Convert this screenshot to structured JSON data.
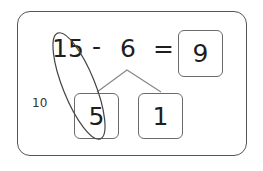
{
  "equation": {
    "minuend": "15",
    "operator": "-",
    "subtrahend": "6",
    "equals": "=",
    "result": "9"
  },
  "decomposition": {
    "left_part": "5",
    "right_part": "1",
    "grouping_label": "10"
  },
  "colors": {
    "frame": "#555555",
    "box_border": "#6a6a6a",
    "branch_line": "#888888",
    "ellipse": "#444444",
    "text": "#1e1e1e"
  }
}
